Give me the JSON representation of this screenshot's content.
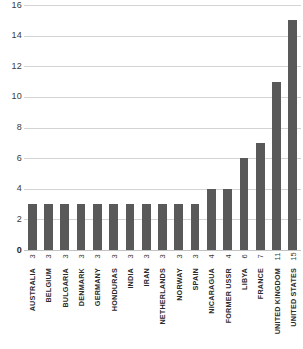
{
  "chart_data": {
    "type": "bar",
    "title": "",
    "subtitle": "",
    "xlabel": "",
    "ylabel": "",
    "ylim": [
      0,
      16
    ],
    "ytick_step": 2,
    "grid": true,
    "legend": false,
    "orientation": "vertical",
    "bar_color": "#595959",
    "gridline_color": "#d4d4d4",
    "background_color": "#ffffff",
    "categories": [
      "AUSTRALIA",
      "BELGIUM",
      "BULGARIA",
      "DENMARK",
      "GERMANY",
      "HONDURAS",
      "INDIA",
      "IRAN",
      "NETHERLANDS",
      "NORWAY",
      "SPAIN",
      "NICARAGUA",
      "FORMER USSR",
      "LIBYA",
      "FRANCE",
      "UNITED KINGDOM",
      "UNITED STATES"
    ],
    "values": [
      3,
      3,
      3,
      3,
      3,
      3,
      3,
      3,
      3,
      3,
      3,
      4,
      4,
      6,
      7,
      11,
      15
    ],
    "value_labels": [
      "3",
      "3",
      "3",
      "3",
      "3",
      "3",
      "3",
      "3",
      "3",
      "3",
      "3",
      "4",
      "4",
      "6",
      "7",
      "11",
      "15"
    ],
    "ytick_labels": [
      "0",
      "2",
      "4",
      "6",
      "8",
      "10",
      "12",
      "14",
      "16"
    ],
    "ytick_values": [
      0,
      2,
      4,
      6,
      8,
      10,
      12,
      14,
      16
    ]
  }
}
